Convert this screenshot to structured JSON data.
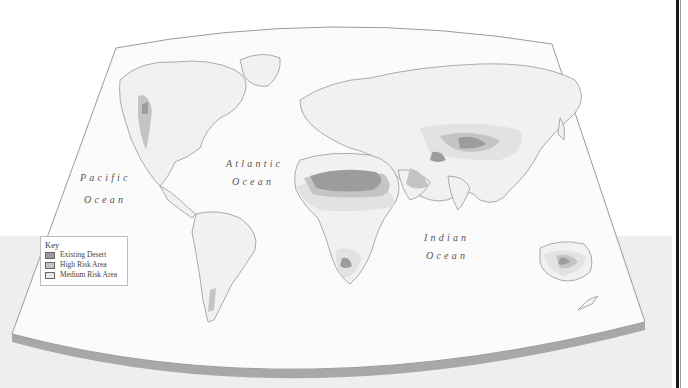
{
  "map": {
    "projection_shape": "curved world map panel",
    "colors": {
      "existing_desert": "#9c9c9c",
      "high_risk_area": "#c4c4c4",
      "medium_risk_area": "#e2e2e2",
      "land": "#f1f1f1",
      "ocean": "#fbfbfb",
      "coastline": "#8a8a8a",
      "panel_edge": "#a6a6a6"
    },
    "ocean_labels": [
      {
        "name": "pacific",
        "line1": "Pacific",
        "line2": "Ocean"
      },
      {
        "name": "atlantic",
        "line1": "Atlantic",
        "line2": "Ocean"
      },
      {
        "name": "indian",
        "line1": "Indian",
        "line2": "Ocean"
      }
    ]
  },
  "key": {
    "title": "Key",
    "items": [
      {
        "label": "Existing Desert",
        "color": "#9c9c9c"
      },
      {
        "label": "High Risk Area",
        "color": "#c4c4c4"
      },
      {
        "label": "Medium Risk Area",
        "color": "#e8e8e8"
      }
    ]
  }
}
